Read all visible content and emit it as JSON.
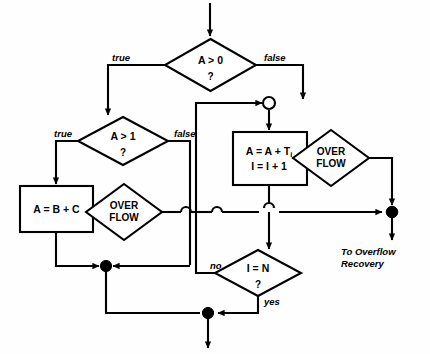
{
  "diagram": {
    "background_color": "#fefefe",
    "line_color": "#000000",
    "nodes": {
      "decision_a_gt_0": {
        "text": "A > 0",
        "question_mark": "?"
      },
      "decision_a_gt_1": {
        "text": "A > 1",
        "question_mark": "?"
      },
      "process_a_eq_b_plus_c": {
        "text": "A = B + C"
      },
      "process_accumulate": {
        "line1_main": "A = A + T",
        "line1_sub": "i",
        "line2": "I = I + 1"
      },
      "overflow_left": {
        "line1": "OVER",
        "line2": "FLOW"
      },
      "overflow_right": {
        "line1": "OVER",
        "line2": "FLOW"
      },
      "decision_i_eq_n": {
        "text": "I = N",
        "question_mark": "?"
      }
    },
    "edge_labels": {
      "a_gt_0_true": "true",
      "a_gt_0_false": "false",
      "a_gt_1_true": "true",
      "a_gt_1_false": "false",
      "i_eq_n_no": "no",
      "i_eq_n_yes": "yes"
    },
    "exits": {
      "overflow_recovery_line1": "To Overflow",
      "overflow_recovery_line2": "Recovery"
    }
  }
}
